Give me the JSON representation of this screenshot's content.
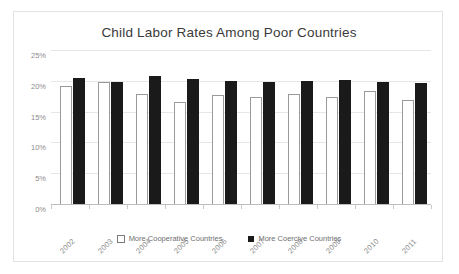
{
  "card": {
    "title": "Child Labor Rates Among Poor Countries"
  },
  "legend": {
    "items": [
      {
        "label": "More Cooperative Countries",
        "swatch": "hollow-square",
        "color": "#ffffff"
      },
      {
        "label": "More Coercive Countries",
        "swatch": "filled-square",
        "color": "#1a1a1a"
      }
    ]
  },
  "axis": {
    "y_ticks": [
      "0%",
      "5%",
      "10%",
      "15%",
      "20%",
      "25%"
    ],
    "y_tick_values": [
      0,
      5,
      10,
      15,
      20,
      25
    ]
  },
  "chart_data": {
    "type": "bar",
    "title": "Child Labor Rates Among Poor Countries",
    "xlabel": "",
    "ylabel": "",
    "ylim": [
      0,
      25
    ],
    "ytick_format": "percent",
    "yticks": [
      0,
      5,
      10,
      15,
      20,
      25
    ],
    "grid": true,
    "legend_position": "bottom-center",
    "categories": [
      "2002",
      "2003",
      "2004",
      "2005",
      "2006",
      "2007",
      "2008",
      "2009",
      "2010",
      "2011"
    ],
    "series": [
      {
        "name": "More Cooperative Countries",
        "color": "#ffffff",
        "edgecolor": "#9a9a9a",
        "values": [
          19.3,
          20.0,
          18.0,
          16.7,
          17.8,
          17.6,
          18.0,
          17.6,
          18.5,
          17.1
        ]
      },
      {
        "name": "More Coercive Countries",
        "color": "#1a1a1a",
        "values": [
          20.7,
          20.0,
          21.0,
          20.5,
          20.2,
          20.0,
          20.2,
          20.3,
          19.9,
          19.8
        ]
      }
    ]
  }
}
